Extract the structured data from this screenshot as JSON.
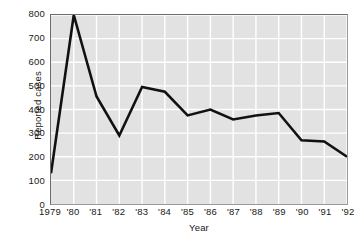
{
  "chart_data": {
    "type": "line",
    "title": "",
    "xlabel": "Year",
    "ylabel": "Reported cases",
    "categories": [
      "1979",
      "'80",
      "'81",
      "'82",
      "'83",
      "'84",
      "'85",
      "'86",
      "'87",
      "'88",
      "'89",
      "'90",
      "'91",
      "'92"
    ],
    "x": [
      1979,
      1980,
      1981,
      1982,
      1983,
      1984,
      1985,
      1986,
      1987,
      1988,
      1989,
      1990,
      1991,
      1992
    ],
    "values": [
      130,
      800,
      455,
      290,
      495,
      475,
      375,
      400,
      358,
      375,
      385,
      270,
      265,
      200
    ],
    "series": [
      {
        "name": "Reported cases",
        "values": [
          130,
          800,
          455,
          290,
          495,
          475,
          375,
          400,
          358,
          375,
          385,
          270,
          265,
          200
        ]
      }
    ],
    "ylim": [
      0,
      800
    ],
    "yticks": [
      0,
      100,
      200,
      300,
      400,
      500,
      600,
      700,
      800
    ],
    "ytick_labels": [
      "0",
      "100",
      "200",
      "300",
      "400",
      "500",
      "600",
      "700",
      "800"
    ],
    "grid": true,
    "grid_color": "#ffffff",
    "plot_background": "#e2e2e2",
    "line_color": "#111111",
    "legend": "none",
    "legend_position": "none"
  }
}
